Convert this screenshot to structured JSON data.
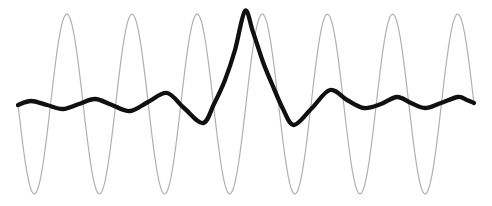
{
  "figure": {
    "background_color": "#ffffff"
  },
  "chart_data": {
    "type": "line",
    "title": "",
    "xlabel": "",
    "ylabel": "",
    "axes_visible": false,
    "grid": false,
    "legend": null,
    "canvas": {
      "width": 492,
      "height": 206,
      "background": "#ffffff"
    },
    "y_is_screen_down": true,
    "series": [
      {
        "name": "sine-wave",
        "role": "thin reference sinusoid, 7 full cycles, constant amplitude",
        "color": "#b0b0b0",
        "stroke_width": 1.2,
        "model": "sine",
        "x_start": 18,
        "x_end": 474,
        "center_y": 104,
        "amplitude": 90,
        "period": 65.14,
        "cycles": 7,
        "first_halfcycle": "downward",
        "y_top": 14,
        "y_bottom": 194
      },
      {
        "name": "wavelet",
        "role": "thick curve: low-amplitude ripple anti-phase on left, large localized burst at centre, low-amplitude ripple in-phase on right",
        "color": "#101010",
        "stroke_width": 4.3,
        "model": "smooth-points",
        "peak": {
          "x": 245,
          "y": 11
        },
        "points": [
          [
            18,
            105
          ],
          [
            31,
            101
          ],
          [
            47,
            105
          ],
          [
            63,
            109
          ],
          [
            79,
            104
          ],
          [
            95,
            99
          ],
          [
            112,
            105
          ],
          [
            130,
            111
          ],
          [
            148,
            102
          ],
          [
            167,
            93
          ],
          [
            184,
            108
          ],
          [
            203,
            123
          ],
          [
            214,
            104
          ],
          [
            225,
            80
          ],
          [
            235,
            50
          ],
          [
            245,
            11
          ],
          [
            253,
            32
          ],
          [
            263,
            62
          ],
          [
            272,
            84
          ],
          [
            283,
            109
          ],
          [
            294,
            125
          ],
          [
            312,
            108
          ],
          [
            330,
            90
          ],
          [
            347,
            100
          ],
          [
            364,
            108
          ],
          [
            381,
            104
          ],
          [
            397,
            97
          ],
          [
            411,
            103
          ],
          [
            425,
            108
          ],
          [
            441,
            103
          ],
          [
            458,
            97
          ],
          [
            467,
            100
          ],
          [
            474,
            103
          ]
        ]
      }
    ]
  }
}
